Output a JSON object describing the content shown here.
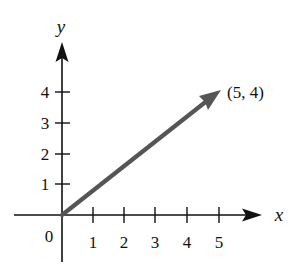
{
  "diagram": {
    "origin_label": "0",
    "x_axis": {
      "label": "x",
      "ticks": [
        "1",
        "2",
        "3",
        "4",
        "5"
      ]
    },
    "y_axis": {
      "label": "y",
      "ticks": [
        "1",
        "2",
        "3",
        "4"
      ]
    },
    "vector": {
      "from": [
        0,
        0
      ],
      "to": [
        5,
        4
      ],
      "label": "(5, 4)",
      "color": "#555555"
    },
    "colors": {
      "axis": "#111111",
      "vector": "#555555",
      "background": "#ffffff"
    }
  }
}
